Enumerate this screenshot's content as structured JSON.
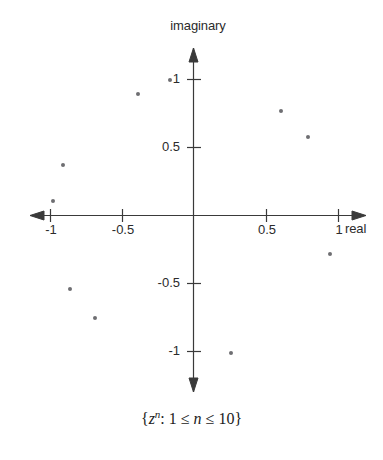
{
  "chart_data": {
    "type": "scatter",
    "title": "",
    "caption_parts": {
      "open_brace": "{",
      "base": "z",
      "exponent": "n",
      "colon": ": ",
      "lower": "1 ",
      "le1": "≤",
      "nvar": " n ",
      "le2": "≤",
      "upper": " 10",
      "close_brace": "}"
    },
    "caption_plain": "{z^n: 1 ≤ n ≤ 10}",
    "xlabel": "real",
    "ylabel": "imaginary",
    "xlim": [
      -1.32,
      1.3
    ],
    "ylim": [
      -1.35,
      1.13
    ],
    "grid": false,
    "legend": null,
    "xticks": [
      -1,
      -0.5,
      0.5,
      1
    ],
    "xtick_labels": [
      "-1",
      "-0.5",
      "0.5",
      "1"
    ],
    "yticks": [
      1,
      0.5,
      -0.5,
      -1
    ],
    "ytick_labels": [
      "1",
      "0.5",
      "-0.5",
      "-1"
    ],
    "marker_color": "#6e6e72",
    "axis_color": "#3a3a3a",
    "points": [
      {
        "n": 1,
        "x": -0.16,
        "y": 1.0
      },
      {
        "n": 2,
        "x": -0.38,
        "y": 0.89
      },
      {
        "n": 3,
        "x": 0.6,
        "y": 0.77
      },
      {
        "n": 4,
        "x": 0.79,
        "y": 0.58
      },
      {
        "n": 5,
        "x": -0.9,
        "y": 0.37
      },
      {
        "n": 6,
        "x": -0.97,
        "y": 0.11
      },
      {
        "n": 7,
        "x": 0.94,
        "y": -0.28
      },
      {
        "n": 8,
        "x": -0.85,
        "y": -0.54
      },
      {
        "n": 9,
        "x": -0.68,
        "y": -0.75
      },
      {
        "n": 10,
        "x": 0.26,
        "y": -1.01
      }
    ]
  }
}
